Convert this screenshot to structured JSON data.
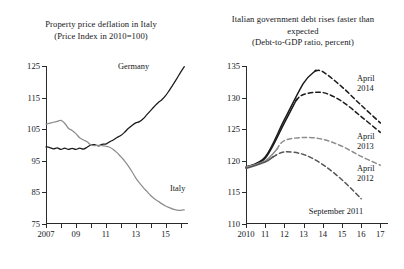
{
  "figure": {
    "panels": [
      {
        "key": "left",
        "title_lines": [
          "Property price deflation in Italy",
          "(Price Index in 2010=100)"
        ],
        "annotations": [
          {
            "name": "series-label-germany",
            "text": "Germany"
          },
          {
            "name": "series-label-italy",
            "text": "Italy"
          }
        ]
      },
      {
        "key": "right",
        "title_lines": [
          "Italian government debt rises faster than",
          "expected",
          "(Debt-to-GDP ratio, percent)"
        ],
        "annotations": [
          {
            "name": "series-label-april-2014",
            "text": "April"
          },
          {
            "name": "series-label-april-2014-year",
            "text": "2014"
          },
          {
            "name": "series-label-april-2013",
            "text": "April"
          },
          {
            "name": "series-label-april-2013-year",
            "text": "2013"
          },
          {
            "name": "series-label-april-2012",
            "text": "April"
          },
          {
            "name": "series-label-april-2012-year",
            "text": "2012"
          },
          {
            "name": "series-label-september-2011",
            "text": "September 2011"
          }
        ]
      }
    ]
  },
  "chart_data": [
    {
      "type": "line",
      "panel": "left",
      "title": "Property price deflation in Italy",
      "subtitle": "(Price Index in 2010=100)",
      "xlabel": "",
      "ylabel": "",
      "xlim": [
        2007,
        2016.5
      ],
      "ylim": [
        75,
        125
      ],
      "yticks": [
        75,
        85,
        95,
        105,
        115,
        125
      ],
      "ytick_labels": [
        "75",
        "85",
        "95",
        "105",
        "115",
        "125"
      ],
      "xticks": [
        2007,
        2009,
        2011,
        2013,
        2015
      ],
      "xtick_labels": [
        "2007",
        "09",
        "11",
        "13",
        "15"
      ],
      "grid": false,
      "legend": "inline-annotations",
      "series": [
        {
          "name": "Germany",
          "color": "#1a1a1a",
          "style": "solid",
          "x": [
            2007.0,
            2007.25,
            2007.5,
            2007.75,
            2008.0,
            2008.25,
            2008.5,
            2008.75,
            2009.0,
            2009.25,
            2009.5,
            2009.75,
            2010.0,
            2010.25,
            2010.5,
            2010.75,
            2011.0,
            2011.25,
            2011.5,
            2011.75,
            2012.0,
            2012.25,
            2012.5,
            2012.75,
            2013.0,
            2013.25,
            2013.5,
            2013.75,
            2014.0,
            2014.25,
            2014.5,
            2014.75,
            2015.0,
            2015.25,
            2015.5,
            2015.75,
            2016.0,
            2016.25
          ],
          "values": [
            99.4,
            99.2,
            98.8,
            99.1,
            98.6,
            99.0,
            98.6,
            98.9,
            98.6,
            99.0,
            98.7,
            99.3,
            100.0,
            100.1,
            99.7,
            100.2,
            100.3,
            101.0,
            101.6,
            102.4,
            103.0,
            104.0,
            105.2,
            106.2,
            107.0,
            107.4,
            108.3,
            109.6,
            110.9,
            112.2,
            113.4,
            114.3,
            115.6,
            117.3,
            119.1,
            121.0,
            123.0,
            124.8
          ]
        },
        {
          "name": "Italy",
          "color": "#8d8d8d",
          "style": "solid",
          "x": [
            2007.0,
            2007.25,
            2007.5,
            2007.75,
            2008.0,
            2008.25,
            2008.5,
            2008.75,
            2009.0,
            2009.25,
            2009.5,
            2009.75,
            2010.0,
            2010.25,
            2010.5,
            2010.75,
            2011.0,
            2011.25,
            2011.5,
            2011.75,
            2012.0,
            2012.25,
            2012.5,
            2012.75,
            2013.0,
            2013.25,
            2013.5,
            2013.75,
            2014.0,
            2014.25,
            2014.5,
            2014.75,
            2015.0,
            2015.25,
            2015.5,
            2015.75,
            2016.0,
            2016.25
          ],
          "values": [
            106.6,
            106.9,
            107.2,
            107.5,
            107.8,
            106.9,
            105.3,
            104.6,
            103.6,
            102.3,
            101.6,
            101.0,
            100.0,
            99.8,
            99.9,
            99.8,
            99.6,
            99.3,
            98.6,
            97.6,
            96.3,
            95.0,
            93.4,
            91.6,
            89.6,
            88.0,
            86.6,
            85.3,
            84.0,
            83.0,
            82.2,
            81.4,
            80.7,
            80.2,
            79.7,
            79.4,
            79.3,
            79.5
          ]
        }
      ]
    },
    {
      "type": "line",
      "panel": "right",
      "title": "Italian government debt rises faster than expected",
      "subtitle": "(Debt-to-GDP ratio, percent)",
      "xlabel": "",
      "ylabel": "",
      "xlim": [
        2010,
        2017.4
      ],
      "ylim": [
        110,
        135
      ],
      "yticks": [
        110,
        115,
        120,
        125,
        130,
        135
      ],
      "ytick_labels": [
        "110",
        "115",
        "120",
        "125",
        "130",
        "135"
      ],
      "xticks": [
        2010,
        2011,
        2012,
        2013,
        2014,
        2015,
        2016,
        2017
      ],
      "xtick_labels": [
        "2010",
        "11",
        "12",
        "13",
        "14",
        "15",
        "16",
        "17"
      ],
      "grid": false,
      "legend": "inline-annotations",
      "series": [
        {
          "name": "April 2014",
          "color": "#1a1a1a",
          "style": "solid-then-dashed",
          "split_x": 2013.6,
          "x": [
            2010,
            2011,
            2012,
            2013,
            2013.6,
            2014,
            2015,
            2016,
            2017
          ],
          "values": [
            119.0,
            120.6,
            126.5,
            132.3,
            134.2,
            134.1,
            131.7,
            128.8,
            126.0
          ]
        },
        {
          "name": "April 2013",
          "color": "#1a1a1a",
          "style": "solid-then-dashed",
          "split_x": 2012.6,
          "x": [
            2010,
            2011,
            2012,
            2012.6,
            2013,
            2014,
            2015,
            2016,
            2017
          ],
          "values": [
            119.0,
            120.4,
            126.0,
            129.5,
            130.5,
            130.8,
            129.4,
            127.0,
            124.5
          ]
        },
        {
          "name": "April 2012",
          "color": "#8d8d8d",
          "style": "solid-then-dashed",
          "split_x": 2011.6,
          "x": [
            2010,
            2011,
            2011.6,
            2012,
            2013,
            2014,
            2015,
            2016,
            2017
          ],
          "values": [
            119.0,
            120.0,
            121.8,
            123.2,
            123.7,
            123.4,
            122.3,
            120.7,
            119.3
          ]
        },
        {
          "name": "September 2011",
          "color": "#555555",
          "style": "solid-then-dashed",
          "split_x": 2011.4,
          "x": [
            2010,
            2011,
            2011.4,
            2012,
            2013,
            2014,
            2015,
            2016
          ],
          "values": [
            118.8,
            119.8,
            120.6,
            121.4,
            121.0,
            119.4,
            117.0,
            114.0
          ]
        }
      ]
    }
  ]
}
